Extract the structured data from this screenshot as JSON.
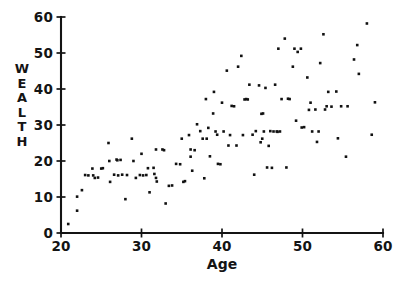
{
  "chart_data": {
    "type": "scatter",
    "title": "",
    "xlabel": "Age",
    "ylabel": "WEALTH",
    "ylabel_letters": [
      "W",
      "E",
      "A",
      "L",
      "T",
      "H"
    ],
    "xlim": [
      20,
      60
    ],
    "ylim": [
      0,
      60
    ],
    "xticks": [
      20,
      30,
      40,
      50,
      60
    ],
    "yticks": [
      0,
      10,
      20,
      30,
      40,
      50,
      60
    ],
    "xtick_labels": [
      "20",
      "30",
      "40",
      "50",
      "60"
    ],
    "ytick_labels": [
      "0",
      "10",
      "20",
      "30",
      "40",
      "50",
      "60"
    ],
    "grid": false,
    "legend": false,
    "marker": "square-dot",
    "marker_color": "#111111",
    "marker_size_px": 2.6,
    "axes_color": "#141414",
    "background_color": "#ffffff",
    "n_points": 134,
    "points": [
      [
        20.9,
        2.5
      ],
      [
        22.0,
        10.1
      ],
      [
        22.0,
        6.2
      ],
      [
        22.6,
        11.9
      ],
      [
        23.0,
        16.1
      ],
      [
        23.9,
        17.9
      ],
      [
        24.2,
        15.3
      ],
      [
        24.6,
        15.4
      ],
      [
        25.0,
        17.9
      ],
      [
        25.9,
        25.0
      ],
      [
        26.0,
        20.0
      ],
      [
        26.1,
        14.2
      ],
      [
        26.6,
        16.2
      ],
      [
        26.9,
        20.4
      ],
      [
        27.0,
        20.2
      ],
      [
        27.1,
        16.0
      ],
      [
        27.6,
        16.2
      ],
      [
        28.0,
        9.4
      ],
      [
        28.8,
        26.2
      ],
      [
        29.0,
        20.0
      ],
      [
        29.3,
        15.3
      ],
      [
        29.8,
        16.1
      ],
      [
        30.0,
        22.0
      ],
      [
        30.6,
        16.1
      ],
      [
        31.0,
        11.3
      ],
      [
        31.5,
        18.1
      ],
      [
        31.8,
        23.2
      ],
      [
        31.8,
        15.3
      ],
      [
        31.9,
        14.3
      ],
      [
        32.6,
        23.2
      ],
      [
        32.8,
        23.0
      ],
      [
        33.0,
        8.2
      ],
      [
        33.8,
        13.2
      ],
      [
        34.3,
        19.2
      ],
      [
        35.0,
        26.2
      ],
      [
        35.4,
        14.4
      ],
      [
        35.9,
        27.2
      ],
      [
        36.1,
        23.2
      ],
      [
        36.1,
        21.2
      ],
      [
        36.3,
        17.3
      ],
      [
        36.9,
        30.2
      ],
      [
        37.3,
        28.3
      ],
      [
        37.6,
        26.2
      ],
      [
        37.8,
        15.2
      ],
      [
        38.0,
        37.2
      ],
      [
        38.3,
        29.2
      ],
      [
        38.5,
        21.3
      ],
      [
        38.9,
        33.2
      ],
      [
        39.0,
        39.2
      ],
      [
        39.2,
        28.2
      ],
      [
        39.4,
        27.3
      ],
      [
        39.5,
        19.2
      ],
      [
        40.0,
        36.2
      ],
      [
        40.6,
        45.1
      ],
      [
        40.8,
        24.3
      ],
      [
        41.0,
        27.2
      ],
      [
        41.5,
        35.2
      ],
      [
        42.0,
        46.2
      ],
      [
        42.4,
        49.2
      ],
      [
        42.6,
        27.2
      ],
      [
        43.0,
        37.2
      ],
      [
        43.4,
        41.2
      ],
      [
        43.8,
        27.3
      ],
      [
        44.0,
        16.2
      ],
      [
        44.6,
        41.0
      ],
      [
        44.8,
        25.2
      ],
      [
        45.1,
        33.2
      ],
      [
        45.2,
        28.2
      ],
      [
        45.4,
        40.3
      ],
      [
        45.6,
        18.2
      ],
      [
        45.8,
        24.2
      ],
      [
        46.2,
        18.1
      ],
      [
        46.4,
        28.2
      ],
      [
        46.6,
        41.2
      ],
      [
        46.8,
        28.2
      ],
      [
        47.0,
        51.2
      ],
      [
        47.4,
        37.2
      ],
      [
        47.8,
        54.0
      ],
      [
        48.0,
        18.2
      ],
      [
        48.4,
        37.2
      ],
      [
        48.8,
        46.2
      ],
      [
        49.2,
        31.2
      ],
      [
        49.4,
        50.3
      ],
      [
        49.8,
        51.2
      ],
      [
        49.9,
        29.3
      ],
      [
        50.6,
        43.2
      ],
      [
        51.0,
        36.2
      ],
      [
        51.2,
        28.2
      ],
      [
        51.6,
        34.3
      ],
      [
        51.8,
        25.3
      ],
      [
        52.2,
        47.2
      ],
      [
        52.6,
        55.2
      ],
      [
        52.8,
        34.3
      ],
      [
        53.2,
        39.2
      ],
      [
        53.6,
        35.1
      ],
      [
        54.2,
        39.3
      ],
      [
        54.4,
        26.3
      ],
      [
        54.8,
        35.2
      ],
      [
        55.4,
        21.2
      ],
      [
        56.4,
        48.2
      ],
      [
        56.8,
        52.2
      ],
      [
        57.0,
        44.2
      ],
      [
        58.0,
        58.2
      ],
      [
        58.6,
        27.3
      ],
      [
        59.0,
        36.3
      ],
      [
        24.0,
        16.0
      ],
      [
        27.4,
        20.3
      ],
      [
        30.2,
        16.0
      ],
      [
        31.6,
        16.4
      ],
      [
        34.8,
        19.1
      ],
      [
        36.6,
        23.0
      ],
      [
        38.1,
        26.2
      ],
      [
        39.8,
        19.1
      ],
      [
        40.2,
        28.2
      ],
      [
        41.8,
        24.3
      ],
      [
        43.2,
        37.1
      ],
      [
        44.2,
        28.3
      ],
      [
        45.0,
        26.2
      ],
      [
        46.0,
        28.3
      ],
      [
        47.2,
        28.2
      ],
      [
        48.2,
        37.3
      ],
      [
        49.0,
        51.2
      ],
      [
        50.2,
        29.4
      ],
      [
        52.0,
        28.2
      ],
      [
        53.0,
        35.2
      ],
      [
        35.2,
        14.2
      ],
      [
        33.4,
        13.1
      ],
      [
        30.8,
        18.0
      ],
      [
        28.2,
        16.1
      ],
      [
        25.2,
        18.0
      ],
      [
        23.4,
        16.0
      ],
      [
        41.2,
        35.3
      ],
      [
        42.8,
        37.1
      ],
      [
        44.9,
        33.1
      ],
      [
        46.9,
        28.1
      ],
      [
        50.8,
        34.2
      ],
      [
        55.6,
        35.2
      ]
    ]
  }
}
